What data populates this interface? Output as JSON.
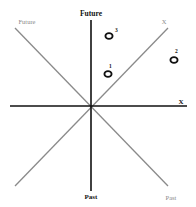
{
  "diagram": {
    "axes": {
      "time_axis_top_label": "Future",
      "time_axis_bottom_label": "Past",
      "space_axis_label": "X"
    },
    "light_cone": {
      "upper_left_label": "Future",
      "upper_right_label": "X",
      "lower_right_label": "Past"
    },
    "events": [
      {
        "label": "1",
        "x": 108,
        "y": 73
      },
      {
        "label": "2",
        "x": 174,
        "y": 59
      },
      {
        "label": "3",
        "x": 109,
        "y": 35
      }
    ],
    "colors": {
      "axis": "#111111",
      "cone": "#8a8a8a",
      "cone_label": "#8a8a8a",
      "event": "#111111"
    }
  }
}
